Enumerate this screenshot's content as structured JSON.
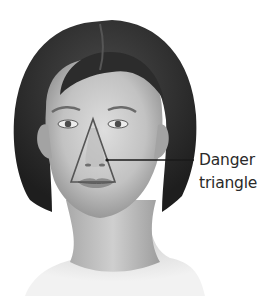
{
  "figure": {
    "annotation": {
      "label_line1": "Danger",
      "label_line2": "triangle",
      "shape": "triangle-outline",
      "vertices": [
        [
          93,
          119
        ],
        [
          71,
          182
        ],
        [
          115,
          182
        ]
      ],
      "leader_line": {
        "from": [
          107,
          160
        ],
        "to": [
          194,
          160
        ]
      }
    }
  },
  "colors": {
    "background": "#ffffff",
    "hair": "#2b2b2b",
    "skin_light": "#d9d9d9",
    "skin_mid": "#b4b4b4",
    "skin_dark": "#8a8a8a",
    "outline": "#4a4a4a",
    "text": "#2a2a2a"
  }
}
